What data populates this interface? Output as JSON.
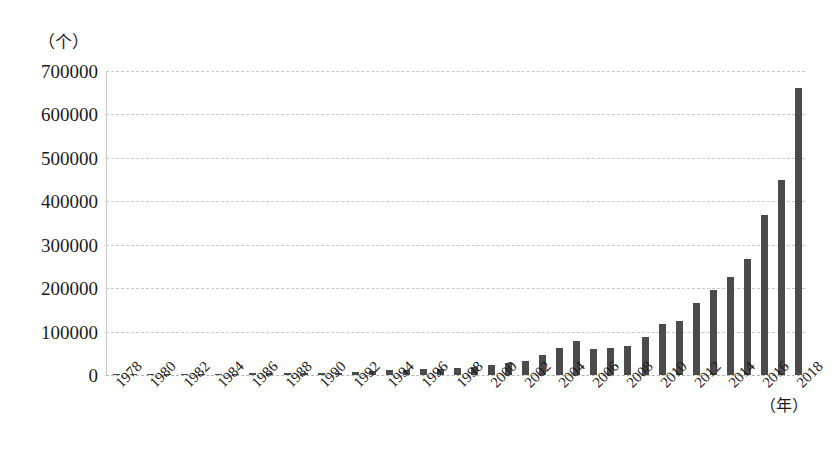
{
  "chart_data": {
    "type": "bar",
    "title": "",
    "subtitle": "",
    "xlabel": "（年）",
    "ylabel": "（个）",
    "ylim": [
      0,
      700000
    ],
    "ytick_labels": [
      "700000",
      "600000",
      "500000",
      "400000",
      "300000",
      "200000",
      "100000",
      "0"
    ],
    "ytick_values": [
      700000,
      600000,
      500000,
      400000,
      300000,
      200000,
      100000,
      0
    ],
    "grid": true,
    "legend": false,
    "xtick_step": 2,
    "xtick_labels": [
      "1978",
      "1980",
      "1982",
      "1984",
      "1986",
      "1988",
      "1990",
      "1992",
      "1994",
      "1996",
      "1998",
      "2000",
      "2002",
      "2004",
      "2006",
      "2008",
      "2010",
      "2012",
      "2014",
      "2016",
      "2018"
    ],
    "bar_color": "#4b4b4b",
    "grid_color": "#c9c9c9",
    "categories": [
      "1978",
      "1979",
      "1980",
      "1981",
      "1982",
      "1983",
      "1984",
      "1985",
      "1986",
      "1987",
      "1988",
      "1989",
      "1990",
      "1991",
      "1992",
      "1993",
      "1994",
      "1995",
      "1996",
      "1997",
      "1998",
      "1999",
      "2000",
      "2001",
      "2002",
      "2003",
      "2004",
      "2005",
      "2006",
      "2007",
      "2008",
      "2009",
      "2010",
      "2011",
      "2012",
      "2013",
      "2014",
      "2015",
      "2016",
      "2017",
      "2018"
    ],
    "values": [
      800,
      1000,
      1200,
      1500,
      1800,
      2200,
      2800,
      3200,
      3600,
      4000,
      4500,
      4200,
      4800,
      5200,
      7000,
      9000,
      11000,
      12000,
      13000,
      14000,
      16000,
      18000,
      22000,
      27000,
      32000,
      45000,
      62000,
      78000,
      60000,
      62000,
      66000,
      88000,
      118000,
      124000,
      165000,
      195000,
      225000,
      267000,
      368000,
      450000,
      660000
    ]
  }
}
